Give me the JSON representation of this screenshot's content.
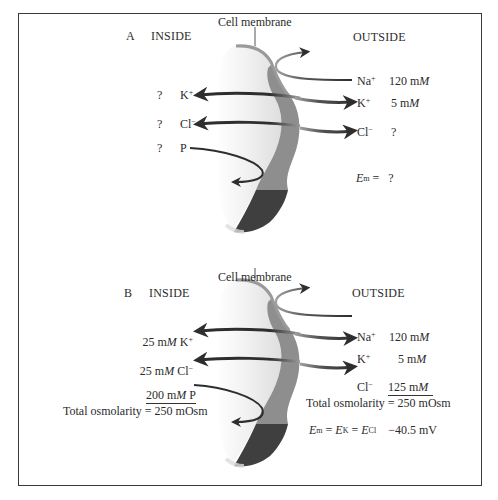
{
  "panel_a": {
    "label": "A",
    "inside_label": "INSIDE",
    "outside_label": "OUTSIDE",
    "membrane_label": "Cell membrane",
    "inside": [
      {
        "ion": "K",
        "charge": "+",
        "conc": "?"
      },
      {
        "ion": "Cl",
        "charge": "−",
        "conc": "?"
      },
      {
        "ion": "P",
        "charge": "",
        "conc": "?"
      }
    ],
    "outside": [
      {
        "ion": "Na",
        "charge": "+",
        "conc_value": "120 m",
        "conc_unit": "M"
      },
      {
        "ion": "K",
        "charge": "+",
        "conc_value": "5 m",
        "conc_unit": "M"
      },
      {
        "ion": "Cl",
        "charge": "−",
        "conc": "?"
      }
    ],
    "em_symbol": "E",
    "em_sub": "m",
    "em_eq": " = ",
    "em_value": "?"
  },
  "panel_b": {
    "label": "B",
    "inside_label": "INSIDE",
    "outside_label": "OUTSIDE",
    "membrane_label": "Cell membrane",
    "inside": [
      {
        "conc_value": "25 m",
        "conc_unit": "M",
        "ion": "K",
        "charge": "+"
      },
      {
        "conc_value": "25 m",
        "conc_unit": "M",
        "ion": "Cl",
        "charge": "−"
      },
      {
        "conc_value": "200 m",
        "conc_unit": "M",
        "ion": "P",
        "charge": ""
      }
    ],
    "inside_total": "Total osmolarity = 250 mOsm",
    "outside": [
      {
        "ion": "Na",
        "charge": "+",
        "conc_value": "120 m",
        "conc_unit": "M"
      },
      {
        "ion": "K",
        "charge": "+",
        "conc_value": "5 m",
        "conc_unit": "M"
      },
      {
        "ion": "Cl",
        "charge": "−",
        "conc_value": "125 m",
        "conc_unit": "M"
      }
    ],
    "outside_total": "Total osmolarity = 250 mOsm",
    "eq": {
      "e": "E",
      "m": "m",
      "k": "K",
      "cl": "Cl",
      "eq1": " = ",
      "eq2": " = ",
      "value": "−40.5 mV"
    }
  },
  "colors": {
    "frame": "#3a3a3a",
    "membrane_light": "#e6e6e6",
    "membrane_band": "#8c8c8c",
    "membrane_dark": "#3f3f3f",
    "arrow": "#2e2e2e"
  }
}
